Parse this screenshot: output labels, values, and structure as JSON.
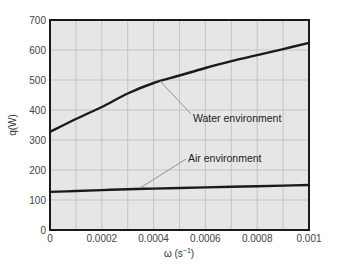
{
  "chart_data": {
    "type": "line",
    "title": "",
    "xlabel": "ω (s⁻¹)",
    "xlabel_base": "ω (s",
    "xlabel_sup": "−1",
    "xlabel_close": ")",
    "ylabel": "q(W)",
    "xlim": [
      0,
      0.001
    ],
    "ylim": [
      0,
      700
    ],
    "grid": true,
    "x_ticks": [
      "0",
      "0.0002",
      "0.0004",
      "0.0006",
      "0.0008",
      "0.001"
    ],
    "y_ticks": [
      "0",
      "100",
      "200",
      "300",
      "400",
      "500",
      "600",
      "700"
    ],
    "x": [
      0,
      0.0001,
      0.0002,
      0.0003,
      0.0004,
      0.0005,
      0.0006,
      0.0007,
      0.0008,
      0.0009,
      0.001
    ],
    "series": [
      {
        "name": "Water environment",
        "values": [
          327,
          370,
          410,
          455,
          490,
          515,
          540,
          563,
          583,
          603,
          624
        ]
      },
      {
        "name": "Air environment",
        "values": [
          127,
          130,
          133,
          136,
          138,
          140,
          142,
          144,
          146,
          148,
          150
        ]
      }
    ],
    "annotations": [
      {
        "text": "Water environment",
        "series": "Water environment"
      },
      {
        "text": "Air environment",
        "series": "Air environment"
      }
    ],
    "colors": {
      "plot_bg": "#e6e6e6",
      "grid": "#bdbdbd",
      "line": "#1a1a1a",
      "leader": "#888888"
    }
  }
}
